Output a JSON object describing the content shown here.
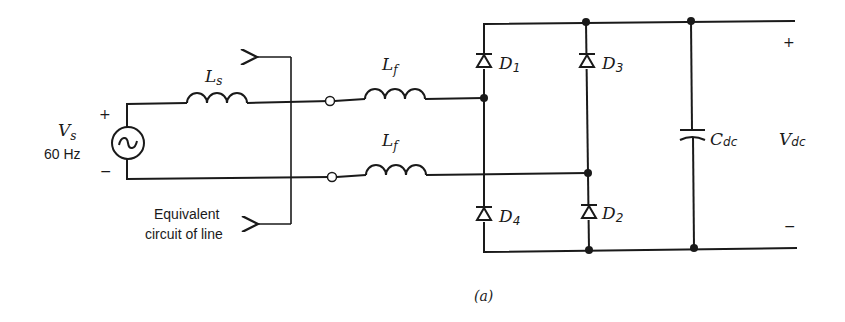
{
  "source": {
    "symbol": "V",
    "subscript": "s",
    "frequency": "60 Hz",
    "plus": "+",
    "minus": "−",
    "icon": "ac-source-icon"
  },
  "line": {
    "inductor": {
      "symbol": "L",
      "subscript": "s"
    },
    "bracket_label_line1": "Equivalent",
    "bracket_label_line2": "circuit of line"
  },
  "filter": {
    "upper": {
      "symbol": "L",
      "subscript": "f"
    },
    "lower": {
      "symbol": "L",
      "subscript": "f"
    }
  },
  "bridge": {
    "diodes": [
      {
        "symbol": "D",
        "subscript": "1"
      },
      {
        "symbol": "D",
        "subscript": "3"
      },
      {
        "symbol": "D",
        "subscript": "4"
      },
      {
        "symbol": "D",
        "subscript": "2"
      }
    ]
  },
  "dc_link": {
    "capacitor": {
      "symbol": "C",
      "subscript": "dc"
    },
    "output": {
      "symbol": "V",
      "subscript": "dc",
      "plus": "+",
      "minus": "−"
    }
  },
  "caption": "(a)",
  "colors": {
    "ink": "#1a1a1a",
    "background": "#ffffff"
  }
}
